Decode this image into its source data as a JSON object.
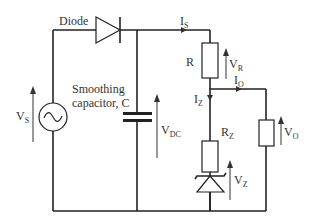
{
  "diagram": {
    "type": "circuit",
    "labels": {
      "diode": "Diode",
      "smoothing_line1": "Smoothing",
      "smoothing_line2": "capacitor, C",
      "vs_main": "V",
      "vs_sub": "S",
      "vdc_main": "V",
      "vdc_sub": "DC",
      "is_main": "I",
      "is_sub": "S",
      "r": "R",
      "vr_main": "V",
      "vr_sub": "R",
      "io_main": "I",
      "io_sub": "O",
      "iz_main": "I",
      "iz_sub": "Z",
      "rz_main": "R",
      "rz_sub": "Z",
      "vo_main": "V",
      "vo_sub": "O",
      "vz_main": "V",
      "vz_sub": "Z"
    },
    "components": [
      {
        "id": "ac-source",
        "label": "V_S",
        "symbol": "sine-source"
      },
      {
        "id": "diode",
        "label": "Diode",
        "symbol": "diode"
      },
      {
        "id": "capacitor",
        "label": "Smoothing capacitor, C",
        "symbol": "capacitor"
      },
      {
        "id": "series-resistor",
        "label": "R",
        "symbol": "resistor"
      },
      {
        "id": "zener-resistor",
        "label": "R_Z",
        "symbol": "resistor"
      },
      {
        "id": "zener-diode",
        "label": "V_Z",
        "symbol": "zener"
      },
      {
        "id": "load-resistor",
        "label": "V_O",
        "symbol": "resistor"
      }
    ],
    "colors": {
      "line": "#222222",
      "text": "#333333",
      "background": "#ffffff"
    }
  }
}
